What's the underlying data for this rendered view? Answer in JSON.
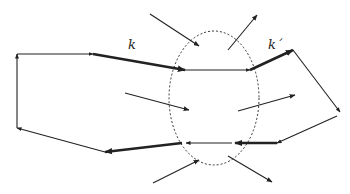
{
  "diagram": {
    "type": "network-cycle-with-cut-region",
    "labels": {
      "k": "k",
      "k_prime": "k´"
    },
    "colors": {
      "stroke": "#222222",
      "background": "#ffffff"
    },
    "region": {
      "shape": "ellipse",
      "style": "dashed",
      "cx": 214,
      "cy": 98,
      "rx": 45,
      "ry": 67
    },
    "cycle_edges": [
      {
        "id": "e1",
        "from": [
          17,
          128
        ],
        "to": [
          17,
          54
        ],
        "weight": "thin"
      },
      {
        "id": "e2",
        "from": [
          17,
          54
        ],
        "to": [
          93,
          54
        ],
        "weight": "thin"
      },
      {
        "id": "e3",
        "from": [
          93,
          54
        ],
        "to": [
          185,
          70
        ],
        "weight": "thick",
        "label": "k"
      },
      {
        "id": "e4",
        "from": [
          185,
          70
        ],
        "to": [
          250,
          70
        ],
        "weight": "thin"
      },
      {
        "id": "e5",
        "from": [
          250,
          70
        ],
        "to": [
          293,
          50
        ],
        "weight": "thick",
        "label": "k´"
      },
      {
        "id": "e6",
        "from": [
          293,
          50
        ],
        "to": [
          340,
          112
        ],
        "weight": "thin"
      },
      {
        "id": "e7",
        "from": [
          337,
          116
        ],
        "to": [
          277,
          143
        ],
        "weight": "thin"
      },
      {
        "id": "e8",
        "from": [
          277,
          143
        ],
        "to": [
          235,
          143
        ],
        "weight": "thick"
      },
      {
        "id": "e9",
        "from": [
          232,
          143
        ],
        "to": [
          186,
          143
        ],
        "weight": "thin"
      },
      {
        "id": "e10",
        "from": [
          182,
          143
        ],
        "to": [
          105,
          152
        ],
        "weight": "thick"
      },
      {
        "id": "e11",
        "from": [
          105,
          152
        ],
        "to": [
          17,
          128
        ],
        "weight": "thin"
      }
    ],
    "crossing_arrows": [
      {
        "id": "c1",
        "from": [
          150,
          14
        ],
        "to": [
          199,
          46
        ]
      },
      {
        "id": "c2",
        "from": [
          228,
          50
        ],
        "to": [
          257,
          15
        ]
      },
      {
        "id": "c3",
        "from": [
          125,
          93
        ],
        "to": [
          189,
          110
        ]
      },
      {
        "id": "c4",
        "from": [
          238,
          111
        ],
        "to": [
          295,
          95
        ]
      },
      {
        "id": "c5",
        "from": [
          153,
          183
        ],
        "to": [
          199,
          160
        ]
      },
      {
        "id": "c6",
        "from": [
          228,
          156
        ],
        "to": [
          272,
          182
        ]
      }
    ]
  }
}
